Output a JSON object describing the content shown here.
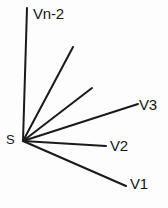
{
  "figure": {
    "background_color": "#fdfdfd",
    "stroke_color": "#1a1a1a",
    "width": 168,
    "height": 208,
    "vertex": {
      "label": "S",
      "x": 23,
      "y": 141
    },
    "labels": {
      "vertex": "S",
      "ray_top": "Vn-2",
      "ray_v3": "V3",
      "ray_v2": "V2",
      "ray_v1": "V1"
    },
    "rays": [
      {
        "name": "Vn-2",
        "label": "Vn-2",
        "x1": 23,
        "y1": 141,
        "x2": 27,
        "y2": 8,
        "width": 2.0,
        "labeled": true
      },
      {
        "name": "ray-4",
        "label": "",
        "x1": 23,
        "y1": 141,
        "x2": 73,
        "y2": 47,
        "width": 2.0,
        "labeled": false
      },
      {
        "name": "ray-3",
        "label": "",
        "x1": 23,
        "y1": 141,
        "x2": 92,
        "y2": 88,
        "width": 2.0,
        "labeled": false
      },
      {
        "name": "V3",
        "label": "V3",
        "x1": 23,
        "y1": 141,
        "x2": 138,
        "y2": 104,
        "width": 2.0,
        "labeled": true
      },
      {
        "name": "V2",
        "label": "V2",
        "x1": 23,
        "y1": 141,
        "x2": 106,
        "y2": 146,
        "width": 2.0,
        "labeled": true
      },
      {
        "name": "V1",
        "label": "V1",
        "x1": 23,
        "y1": 141,
        "x2": 126,
        "y2": 186,
        "width": 2.0,
        "labeled": true
      }
    ]
  }
}
